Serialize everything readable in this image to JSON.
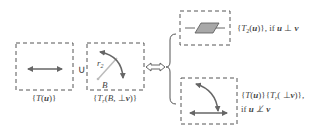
{
  "diagram": {
    "box_left": {
      "label_parts": [
        "{",
        "T",
        "(",
        "u",
        ")}"
      ]
    },
    "union_symbol": "∪",
    "box_middle": {
      "radius_label": "r",
      "radius_sub": "2",
      "point_label": "B",
      "label_parts": [
        "{",
        "T",
        "r",
        "(",
        "B",
        ",  ⊥",
        "v",
        ")}"
      ]
    },
    "equivalence_symbol": "⇔",
    "branch_top": {
      "label_parts": [
        "{",
        "T",
        "2",
        "(",
        "u",
        ")}, if ",
        "u",
        " ⊥ ",
        "v"
      ]
    },
    "branch_bottom": {
      "label_line1_parts": [
        "{",
        "T",
        "(",
        "u",
        ")}{",
        "T",
        "r",
        "( ⊥",
        "v",
        ")},"
      ],
      "label_line2_parts": [
        "if ",
        "u",
        " ⊥̸ ",
        "v"
      ]
    },
    "colors": {
      "stroke": "#555555",
      "arrow": "#666666",
      "plane_fill": "#a8a8a8",
      "radius_line": "#bbbbbb"
    }
  }
}
